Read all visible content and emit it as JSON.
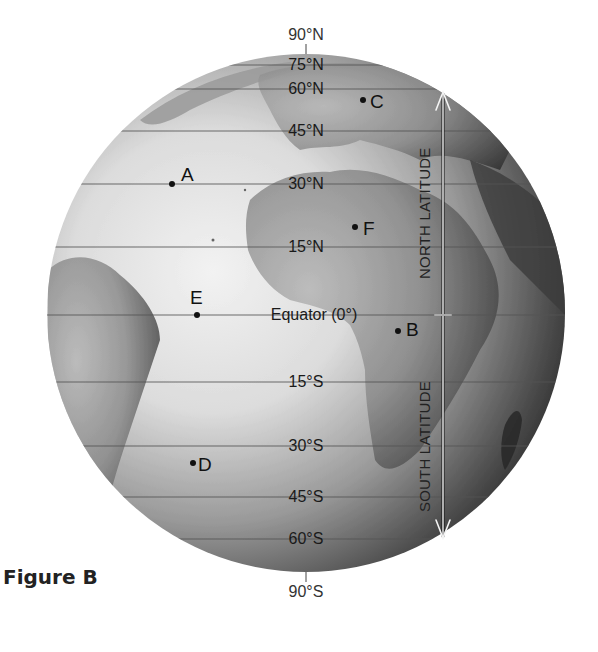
{
  "caption": "Figure B",
  "poles": {
    "north": "90°N",
    "south": "90°S"
  },
  "latitude_lines": [
    {
      "label": "75°N",
      "y": 65
    },
    {
      "label": "60°N",
      "y": 89
    },
    {
      "label": "45°N",
      "y": 131
    },
    {
      "label": "30°N",
      "y": 184
    },
    {
      "label": "15°N",
      "y": 247
    },
    {
      "label": "Equator (0°)",
      "y": 315
    },
    {
      "label": "15°S",
      "y": 382
    },
    {
      "label": "30°S",
      "y": 446
    },
    {
      "label": "45°S",
      "y": 497
    },
    {
      "label": "60°S",
      "y": 539
    }
  ],
  "points": [
    {
      "letter": "A",
      "x": 172,
      "y": 184
    },
    {
      "letter": "B",
      "x": 398,
      "y": 331
    },
    {
      "letter": "C",
      "x": 363,
      "y": 100
    },
    {
      "letter": "D",
      "x": 193,
      "y": 463
    },
    {
      "letter": "E",
      "x": 197,
      "y": 315
    },
    {
      "letter": "F",
      "x": 355,
      "y": 227
    }
  ],
  "arrow_labels": {
    "north": "NORTH LATITUDE",
    "south": "SOUTH LATITUDE"
  },
  "colors": {
    "ocean_light": "#e8e8e8",
    "ocean_dark": "#1e1e1e",
    "land": "#8a8a8a",
    "grid_line": "#5a5a5a",
    "text": "#1a1a1a"
  }
}
